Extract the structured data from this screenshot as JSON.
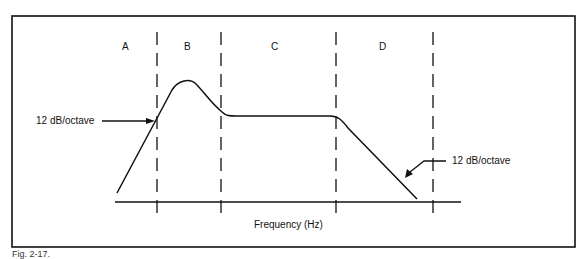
{
  "figure": {
    "regions": [
      "A",
      "B",
      "C",
      "D"
    ],
    "annotations": {
      "left_slope": "12 dB/octave",
      "right_slope": "12 dB/octave"
    },
    "xlabel": "Frequency (Hz)",
    "caption": "Fig. 2-17."
  },
  "colors": {
    "line": "#111111",
    "background": "#ffffff"
  }
}
